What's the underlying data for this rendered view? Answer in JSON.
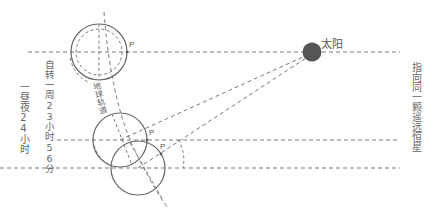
{
  "diagram": {
    "sun_label": "太阳",
    "point_label": "P",
    "solar_day_label": "一昼夜24小时",
    "sidereal_day_label": "自转一周23小时56分",
    "orbit_label": "地球轨道",
    "star_direction_label": "指向同一颗遥远恒星",
    "colors": {
      "line": "#777777",
      "sun": "#555555",
      "text": "#666666"
    }
  }
}
